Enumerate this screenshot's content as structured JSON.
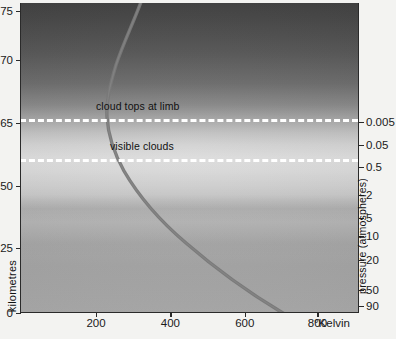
{
  "chart_data": {
    "type": "line",
    "title": "",
    "subtitle": "",
    "xlabel": "°Kelvin",
    "ylabel_left": "kilometres",
    "ylabel_right": "pressure (atmospheres)",
    "xlim": [
      0,
      900
    ],
    "x_ticks": [
      200,
      400,
      600,
      800
    ],
    "x_tick_labels": [
      "200",
      "400",
      "600",
      "800"
    ],
    "left_axis": {
      "label": "kilometres",
      "tick_labels": [
        "75",
        "70",
        "65",
        "50",
        "25",
        "0"
      ],
      "note": "altitude scale, labels clipped at left image edge"
    },
    "right_axis": {
      "label": "pressure (atmospheres)",
      "scale": "logarithmic, increasing downward",
      "tick_labels": [
        "0.005",
        "0.05",
        "0.5",
        "2",
        "5",
        "10",
        "20",
        "50",
        "90"
      ]
    },
    "series": [
      {
        "name": "temperature profile",
        "color": "#7a7a7a",
        "points": [
          [
            320,
            0
          ],
          [
            300,
            10
          ],
          [
            280,
            24
          ],
          [
            262,
            40
          ],
          [
            246,
            58
          ],
          [
            236,
            76
          ],
          [
            230,
            95
          ],
          [
            228,
            112
          ],
          [
            232,
            130
          ],
          [
            244,
            150
          ],
          [
            268,
            175
          ],
          [
            300,
            200
          ],
          [
            345,
            228
          ],
          [
            400,
            253
          ],
          [
            470,
            275
          ],
          [
            550,
            293
          ],
          [
            640,
            305
          ],
          [
            720,
            312
          ]
        ],
        "description": "Venus atmospheric temperature rises from ~230 K near the cloud tops to over 700 K at the surface"
      }
    ],
    "annotations": [
      {
        "text": "cloud tops at limb",
        "pressure": 0.005,
        "line_style": "dashed-white"
      },
      {
        "text": "visible clouds",
        "pressure": 0.5,
        "line_style": "dashed-white"
      }
    ],
    "grid": false,
    "legend": "none",
    "background": "vertical greyscale gradient representing atmospheric haze layers"
  },
  "axes": {
    "x_ticks": [
      {
        "label": "200",
        "pos_pct": 22.5
      },
      {
        "label": "400",
        "pos_pct": 44.5
      },
      {
        "label": "600",
        "pos_pct": 66.5
      },
      {
        "label": "800",
        "pos_pct": 88.0
      }
    ],
    "x_unit_label": "°Kelvin",
    "left_title": "kilometres",
    "left_ticks": [
      {
        "label": "75",
        "top": 8
      },
      {
        "label": "70",
        "top": 57
      },
      {
        "label": "65",
        "top": 120
      },
      {
        "label": "50",
        "top": 183
      },
      {
        "label": "25",
        "top": 245
      },
      {
        "label": "0",
        "top": 310
      }
    ],
    "right_title": "pressure (atmospheres)",
    "right_ticks": [
      {
        "label": "0.005",
        "top": 119
      },
      {
        "label": "0.05",
        "top": 142
      },
      {
        "label": "0.5",
        "top": 164
      },
      {
        "label": "2",
        "top": 192
      },
      {
        "label": "5",
        "top": 215
      },
      {
        "label": "10",
        "top": 233
      },
      {
        "label": "20",
        "top": 257
      },
      {
        "label": "50",
        "top": 287
      },
      {
        "label": "90",
        "top": 303
      }
    ]
  },
  "plot": {
    "dashed_lines": [
      {
        "name": "cloud-tops-line",
        "top_pct": 37.5
      },
      {
        "name": "visible-clouds-line",
        "top_pct": 50.5
      }
    ],
    "annotations": [
      {
        "name": "cloud-tops-at-limb",
        "text": "cloud tops at limb",
        "left": 96,
        "top": 101
      },
      {
        "name": "visible-clouds",
        "text": "visible clouds",
        "left": 110,
        "top": 141
      }
    ],
    "curve_path": "M 122 -4 C 116 14, 104 38, 96 62 C 90 82, 86 98, 87 114 C 88 132, 94 150, 104 168 C 118 192, 140 218, 166 240 C 196 266, 232 292, 268 313"
  },
  "colors": {
    "curve": "#787878",
    "dashed_line": "#ffffff",
    "axis": "#2a2a2a",
    "text": "#111111",
    "page_background": "#f3f3f1"
  }
}
